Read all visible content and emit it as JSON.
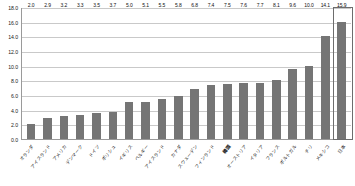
{
  "chart_data": {
    "type": "bar",
    "title": "",
    "subtitle": "",
    "xlabel": "",
    "ylabel": "",
    "ylim": [
      0.0,
      18.0
    ],
    "ytick_step": 2.0,
    "grid": true,
    "legend": "none",
    "bar_color": "#757575",
    "gridline_color": "#c9c9c9",
    "axis_color": "#9a9a9a",
    "highlight_color": "#6d6d6d",
    "value_label_format": "one-decimal",
    "highlighted_category": "日本",
    "emphasized_category": "韓国",
    "categories": [
      "オランダ",
      "アイスランド",
      "アメリカ",
      "デンマーク",
      "ドイツ",
      "ポリシュ",
      "イギリス",
      "ベルギー",
      "アイスランド",
      "カナダ",
      "スウェーデン",
      "フィンランド",
      "韓国",
      "オーストリア",
      "イタリア",
      "フランス",
      "ポルトガル",
      "チリ",
      "メキシコ",
      "日本"
    ],
    "values": [
      2.0,
      2.9,
      3.2,
      3.3,
      3.5,
      3.7,
      5.0,
      5.1,
      5.5,
      5.8,
      6.8,
      7.4,
      7.5,
      7.6,
      7.7,
      8.1,
      9.6,
      10.0,
      14.1,
      15.9
    ],
    "yticks": [
      "0.0",
      "2.0",
      "4.0",
      "6.0",
      "8.0",
      "10.0",
      "12.0",
      "14.0",
      "16.0",
      "18.0"
    ]
  }
}
